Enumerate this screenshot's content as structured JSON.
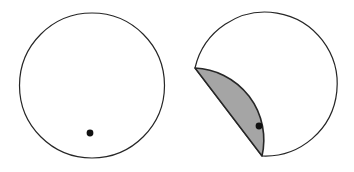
{
  "figure": {
    "background_color": "#ffffff",
    "width": 354,
    "height": 172,
    "panels": [
      {
        "id": "left-panel",
        "name": "unfolded-circle-panel",
        "caption": "",
        "circle": {
          "center_x": 92,
          "center_y": 85.5,
          "radius": 72.5,
          "stroke_color": "#262626",
          "stroke_width": 1.2,
          "fill_color": "none"
        },
        "point": {
          "label": "",
          "x": 90,
          "y": 133,
          "radius": 3.4,
          "color": "#111111"
        }
      },
      {
        "id": "right-panel",
        "name": "folded-circle-panel",
        "caption": "",
        "circle": {
          "center_x": 254,
          "center_y": 84.5,
          "radius": 72,
          "stroke_color": "#262626",
          "stroke_width": 1.2,
          "fill_color": "none"
        },
        "point": {
          "label": "",
          "x": 259,
          "y": 126,
          "radius": 3.4,
          "color": "#111111"
        },
        "fold": {
          "crease_start_x": 195,
          "crease_start_y": 68,
          "crease_end_x": 262,
          "crease_end_y": 156,
          "fill_color": "#a5a5a5",
          "stroke_color": "#262626",
          "stroke_width": 1.6,
          "description": "flap folded so the arc touches the marked point"
        }
      }
    ]
  },
  "colors": {
    "outline": "#262626",
    "shaded_fill": "#a5a5a5",
    "point": "#111111",
    "background": "#ffffff"
  }
}
